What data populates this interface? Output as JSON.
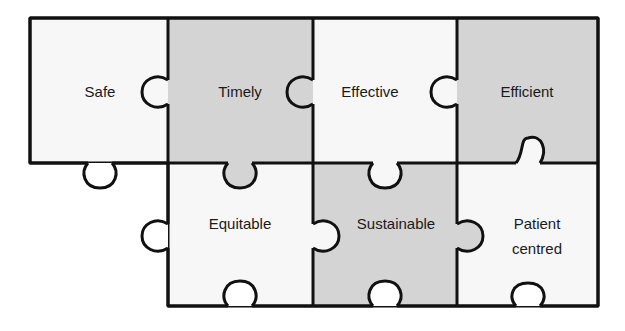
{
  "diagram": {
    "type": "jigsaw-puzzle",
    "colors": {
      "light": "#f7f7f7",
      "gray": "#d4d4d4",
      "outline": "#111111"
    },
    "pieces": [
      {
        "label": "Safe",
        "row": 0,
        "col": 0,
        "fill": "light"
      },
      {
        "label": "Timely",
        "row": 0,
        "col": 1,
        "fill": "gray"
      },
      {
        "label": "Effective",
        "row": 0,
        "col": 2,
        "fill": "light"
      },
      {
        "label": "Efficient",
        "row": 0,
        "col": 3,
        "fill": "gray"
      },
      {
        "label": "Equitable",
        "row": 1,
        "col": 1,
        "fill": "light"
      },
      {
        "label": "Sustainable",
        "row": 1,
        "col": 2,
        "fill": "gray"
      },
      {
        "label": "Patient centred",
        "line1": "Patient",
        "line2": "centred",
        "row": 1,
        "col": 3,
        "fill": "light"
      }
    ]
  }
}
